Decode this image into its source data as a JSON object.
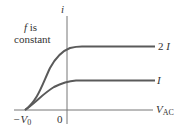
{
  "diagram": {
    "y_axis_label": "i",
    "x_axis_label_main": "V",
    "x_axis_label_sub": "AC",
    "origin_label": "0",
    "stopping_voltage_label": "−V",
    "stopping_voltage_sub": "0",
    "annotation_line1": "f is",
    "annotation_f": "f",
    "annotation_is": " is",
    "annotation_line2": "constant",
    "curves": [
      {
        "name": "higher intensity",
        "label": "2 I",
        "label_num": "2 ",
        "label_var": "I",
        "saturation": "2I"
      },
      {
        "name": "lower intensity",
        "label": "I",
        "label_var": "I",
        "saturation": "I"
      }
    ],
    "colors": {
      "curve": "#5a5a5a",
      "axis": "#777777",
      "text": "#333333"
    }
  }
}
